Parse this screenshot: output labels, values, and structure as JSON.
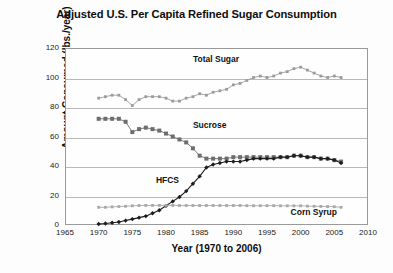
{
  "chart_data": {
    "type": "line",
    "title": "Adjusted U.S. Per Capita Refined Sugar Consumption",
    "xlabel": "Year (1970 to 2006)",
    "ylabel": "Amount Consumed (lbs./year)",
    "xlim": [
      1965,
      2010
    ],
    "ylim": [
      0,
      120
    ],
    "xticks": [
      1965,
      1970,
      1975,
      1980,
      1985,
      1990,
      1995,
      2000,
      2005,
      2010
    ],
    "yticks": [
      0,
      20,
      40,
      60,
      80,
      100,
      120
    ],
    "grid": "horizontal",
    "legend_position": "inline-annotations",
    "x": [
      1970,
      1971,
      1972,
      1973,
      1974,
      1975,
      1976,
      1977,
      1978,
      1979,
      1980,
      1981,
      1982,
      1983,
      1984,
      1985,
      1986,
      1987,
      1988,
      1989,
      1990,
      1991,
      1992,
      1993,
      1994,
      1995,
      1996,
      1997,
      1998,
      1999,
      2000,
      2001,
      2002,
      2003,
      2004,
      2005,
      2006
    ],
    "series": [
      {
        "name": "Total Sugar",
        "color": "#9b9b9b",
        "marker": "small-square",
        "values": [
          86,
          87,
          88,
          88,
          85,
          81,
          85,
          87,
          87,
          87,
          86,
          84,
          84,
          86,
          87,
          89,
          88,
          90,
          91,
          92,
          95,
          96,
          98,
          100,
          101,
          100,
          101,
          103,
          104,
          106,
          107,
          105,
          103,
          101,
          100,
          101,
          100
        ]
      },
      {
        "name": "Sucrose",
        "color": "#6d6d6d",
        "marker": "square",
        "values": [
          72,
          72,
          72,
          72,
          70,
          63,
          65,
          66,
          65,
          64,
          62,
          60,
          58,
          56,
          52,
          47,
          45,
          45,
          45,
          45,
          46,
          46,
          46,
          46,
          46,
          46,
          46,
          46,
          46,
          47,
          47,
          46,
          46,
          45,
          45,
          44,
          43
        ]
      },
      {
        "name": "HFCS",
        "color": "#1d1d1d",
        "marker": "diamond",
        "values": [
          0.7,
          1,
          1.5,
          2,
          3,
          4,
          5,
          6,
          8,
          10,
          13,
          16,
          19,
          23,
          28,
          33,
          39,
          41,
          42,
          43,
          43,
          43,
          44,
          45,
          45,
          45,
          45,
          46,
          46,
          47,
          47,
          46,
          46,
          45,
          45,
          44,
          42
        ]
      },
      {
        "name": "Corn Syrup",
        "color": "#a8a8a8",
        "marker": "small-square",
        "values": [
          12,
          12,
          12.3,
          12.5,
          12.7,
          13,
          13.2,
          13.3,
          13.3,
          13.3,
          13.3,
          13.3,
          13.2,
          13.2,
          13.2,
          13.2,
          13.2,
          13.2,
          13.2,
          13.2,
          13.2,
          13.2,
          13.1,
          13.1,
          13.1,
          13.1,
          13.1,
          13,
          13,
          13,
          13,
          12.8,
          12.7,
          12.6,
          12.5,
          12.4,
          12
        ]
      }
    ],
    "annotations": [
      {
        "text": "Total Sugar",
        "x": 1984,
        "y": 112
      },
      {
        "text": "Sucrose",
        "x": 1984,
        "y": 67
      },
      {
        "text": "HFCS",
        "x": 1978.5,
        "y": 30
      },
      {
        "text": "Corn Syrup",
        "x": 1998.5,
        "y": 8
      }
    ]
  }
}
